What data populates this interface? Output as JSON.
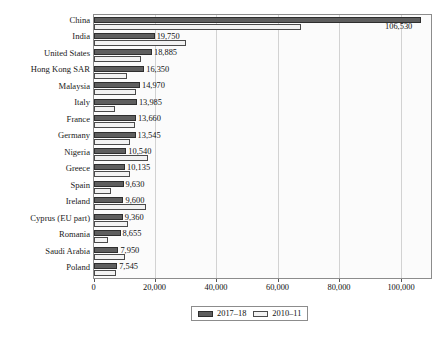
{
  "chart_data": {
    "type": "bar",
    "orientation": "horizontal",
    "title": "",
    "xlabel": "",
    "ylabel": "",
    "xlim": [
      0,
      110000
    ],
    "grid": true,
    "legend_position": "bottom-center",
    "xticks": [
      0,
      20000,
      40000,
      60000,
      80000,
      100000
    ],
    "xtick_labels": [
      "0",
      "20,000",
      "40,000",
      "60,000",
      "80,000",
      "100,000"
    ],
    "categories": [
      "China",
      "India",
      "United States",
      "Hong Kong SAR",
      "Malaysia",
      "Italy",
      "France",
      "Germany",
      "Nigeria",
      "Greece",
      "Spain",
      "Ireland",
      "Cyprus (EU part)",
      "Romania",
      "Saudi Arabia",
      "Poland"
    ],
    "series": [
      {
        "name": "2017–18",
        "color": "#5e5e5e",
        "values": [
          106530,
          19750,
          18885,
          16350,
          14970,
          13985,
          13660,
          13545,
          10540,
          10135,
          9630,
          9600,
          9360,
          8655,
          7950,
          7545
        ],
        "value_labels": [
          "106,530",
          "19,750",
          "18,885",
          "16,350",
          "14,970",
          "13,985",
          "13,660",
          "13,545",
          "10,540",
          "10,135",
          "9,630",
          "9,600",
          "9,360",
          "8,655",
          "7,950",
          "7,545"
        ]
      },
      {
        "name": "2010–11",
        "color": "#f2f2f2",
        "values": [
          67500,
          30100,
          15300,
          10600,
          13800,
          6700,
          13200,
          11800,
          17600,
          11700,
          5400,
          17000,
          11100,
          4400,
          10200,
          7100
        ],
        "value_labels": []
      }
    ]
  },
  "legend": {
    "entries": [
      {
        "label": "2017–18",
        "swatch": "dark-gray-swatch"
      },
      {
        "label": "2010–11",
        "swatch": "light-gray-swatch"
      }
    ]
  }
}
